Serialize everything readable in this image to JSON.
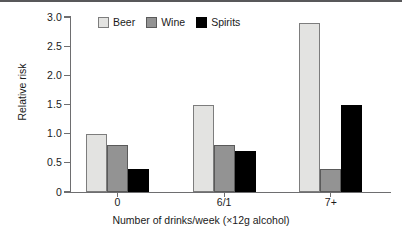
{
  "chart_data": {
    "type": "bar",
    "title": "",
    "subtitle": "",
    "xlabel": "Number of drinks/week (×12g alcohol)",
    "ylabel": "Relative risk",
    "categories": [
      "0",
      "6/1",
      "7+"
    ],
    "series": [
      {
        "name": "Beer",
        "color": "#e3e3e1",
        "values": [
          1.0,
          1.5,
          2.9
        ]
      },
      {
        "name": "Wine",
        "color": "#939393",
        "values": [
          0.8,
          0.8,
          0.4
        ]
      },
      {
        "name": "Spirits",
        "color": "#000000",
        "values": [
          0.4,
          0.7,
          1.5
        ]
      }
    ],
    "ylim": [
      0,
      3.0
    ],
    "y_ticks": [
      0,
      0.5,
      1.0,
      1.5,
      2.0,
      2.5,
      3.0
    ],
    "y_tick_labels": [
      "0",
      "0.5",
      "1.0",
      "1.5",
      "2.0",
      "2.5",
      "3.0"
    ],
    "grid": false,
    "legend_position": "top-center-inside",
    "legend_entries": [
      "Beer",
      "Wine",
      "Spirits"
    ],
    "annotations": []
  },
  "axes": {
    "y_title": "Relative risk",
    "x_title": "Number of drinks/week (×12g alcohol)"
  }
}
